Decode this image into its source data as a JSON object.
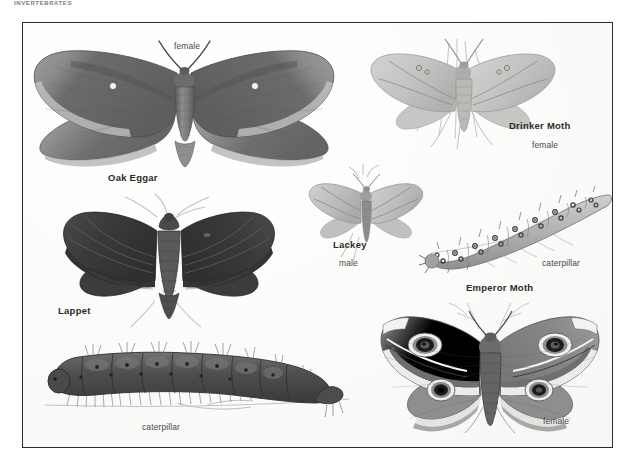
{
  "page": {
    "running_head": "INVERTEBRATES",
    "background_color": "#ffffff",
    "plate_background": "#fdfdfc",
    "plate_border_color": "#2c2c2c",
    "ink_color": "#2b2b2b"
  },
  "plate": {
    "figures": [
      {
        "id": "oak-eggar",
        "name": "Oak Eggar",
        "sex": "female",
        "kind": "moth-adult",
        "tone": "#6f6f6f",
        "name_label": {
          "x": 85,
          "y": 150,
          "text": "Oak Eggar"
        },
        "sex_label": {
          "x": 151,
          "y": 19,
          "text": "female"
        }
      },
      {
        "id": "drinker-moth",
        "name": "Drinker Moth",
        "sex": "female",
        "kind": "moth-adult",
        "tone": "#b9b9b7",
        "name_label": {
          "x": 486,
          "y": 98,
          "text": "Drinker Moth"
        },
        "sex_label": {
          "x": 509,
          "y": 118,
          "text": "female"
        }
      },
      {
        "id": "lackey",
        "name": "Lackey",
        "sex": "male",
        "kind": "moth-adult",
        "tone": "#b3b3b1",
        "name_label": {
          "x": 310,
          "y": 217,
          "text": "Lackey"
        },
        "sex_label": {
          "x": 316,
          "y": 236,
          "text": "male"
        }
      },
      {
        "id": "emperor-moth-caterpillar",
        "name": "Emperor Moth",
        "stage": "caterpillar",
        "kind": "caterpillar",
        "tone": "#9a9a98",
        "name_label": {
          "x": 443,
          "y": 260,
          "text": "Emperor Moth"
        },
        "stage_label": {
          "x": 519,
          "y": 236,
          "text": "caterpillar"
        }
      },
      {
        "id": "lappet",
        "name": "Lappet",
        "kind": "moth-adult",
        "tone": "#3b3b3b",
        "name_label": {
          "x": 35,
          "y": 283,
          "text": "Lappet"
        }
      },
      {
        "id": "lappet-caterpillar",
        "stage": "caterpillar",
        "kind": "caterpillar",
        "tone": "#4d4d4d",
        "stage_label": {
          "x": 119,
          "y": 400,
          "text": "caterpillar"
        }
      },
      {
        "id": "emperor-moth-female",
        "name": "Emperor Moth",
        "sex": "female",
        "kind": "moth-adult",
        "tone": "#8a8a88",
        "sex_label": {
          "x": 520,
          "y": 394,
          "text": "female"
        }
      }
    ]
  }
}
